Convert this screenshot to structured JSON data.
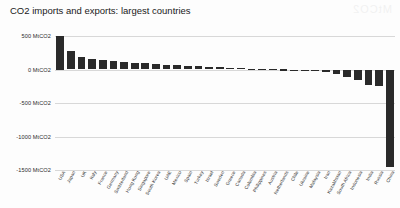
{
  "chart_data": {
    "type": "bar",
    "title": "CO2 imports and exports: largest countries",
    "xlabel": "",
    "ylabel": "",
    "unit": "MtCO2",
    "ylim": [
      -1500,
      500
    ],
    "grid": true,
    "legend": "none",
    "ytick_labels": [
      "500 MtCO2",
      "0 MtCO2",
      "-500 MtCO2",
      "-1000 MtCO2",
      "-1500 MtCO2"
    ],
    "ytick_values": [
      500,
      0,
      -500,
      -1000,
      -1500
    ],
    "categories": [
      "USA",
      "Japan",
      "UK",
      "Italy",
      "France",
      "Germany",
      "Switzerland",
      "Hong Kong",
      "Singapore",
      "South Korea",
      "UAE",
      "Mexico",
      "Spain",
      "Turkey",
      "Israel",
      "Sweden",
      "Greece",
      "Canada",
      "Colombia",
      "Philippines",
      "Austria",
      "Netherlands",
      "Chile",
      "Ukraine",
      "Malaysia",
      "Iran",
      "Kazakhstan",
      "South Africa",
      "Indonesia",
      "India",
      "Russia",
      "China"
    ],
    "values": [
      500,
      270,
      190,
      150,
      140,
      130,
      110,
      100,
      92,
      80,
      68,
      60,
      52,
      45,
      38,
      32,
      26,
      20,
      14,
      9,
      5,
      2,
      -4,
      -10,
      -22,
      -40,
      -65,
      -110,
      -160,
      -230,
      -250,
      -1450
    ]
  },
  "watermark": {
    "text": "MtCO2"
  }
}
